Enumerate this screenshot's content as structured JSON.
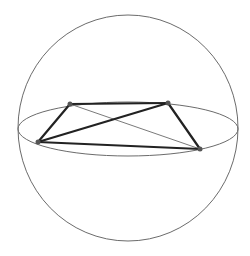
{
  "diagram": {
    "type": "sphere-with-inscribed-quadrilateral",
    "background": "#ffffff",
    "sphere": {
      "cx": 128,
      "cy": 128,
      "rx": 110,
      "ry": 113,
      "stroke": "#6b6b6b",
      "stroke_width": 1
    },
    "equator": {
      "cx": 128,
      "cy": 129,
      "rx": 110,
      "ry": 27,
      "stroke": "#6b6b6b",
      "stroke_width": 1
    },
    "vertices": [
      {
        "id": "A",
        "x": 70,
        "y": 104
      },
      {
        "id": "B",
        "x": 168,
        "y": 103
      },
      {
        "id": "C",
        "x": 38,
        "y": 142
      },
      {
        "id": "D",
        "x": 200,
        "y": 149
      }
    ],
    "vertex_style": {
      "r": 2.5,
      "fill": "#555555"
    },
    "edges": [
      {
        "from": "A",
        "to": "B",
        "style": "front"
      },
      {
        "from": "A",
        "to": "C",
        "style": "front"
      },
      {
        "from": "B",
        "to": "D",
        "style": "front"
      },
      {
        "from": "C",
        "to": "D",
        "style": "front"
      },
      {
        "from": "C",
        "to": "B",
        "style": "front"
      },
      {
        "from": "A",
        "to": "D",
        "style": "back"
      }
    ],
    "edge_styles": {
      "front": {
        "stroke": "#222222",
        "stroke_width": 2.2
      },
      "back": {
        "stroke": "#7a7a7a",
        "stroke_width": 1
      }
    }
  }
}
